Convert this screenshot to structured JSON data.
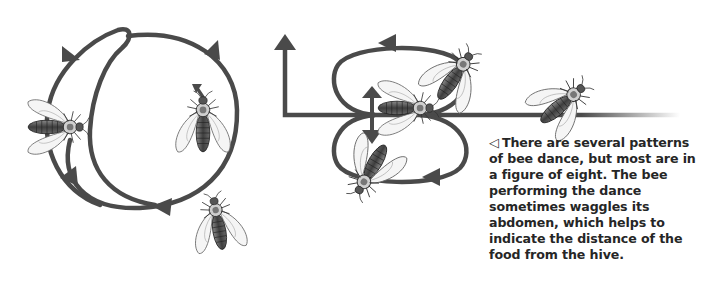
{
  "figure": {
    "caption": {
      "marker": "◁",
      "text": "There are several patterns of bee dance, but most are in a figure of eight. The bee performing the dance sometimes waggles its abdomen, which helps to indicate the distance of the food from the hive."
    },
    "colors": {
      "path_line": "#4a4a4a",
      "bee_body": "#5a5a5a",
      "bee_wing": "#f4f4f4",
      "text": "#262626",
      "background": "#ffffff"
    },
    "panels": [
      {
        "name": "round-dance",
        "description": "circular loop path with arrowheads and three bees"
      },
      {
        "name": "waggle-dance",
        "description": "figure-of-eight path with waggle run, up arrow and three bees"
      }
    ]
  }
}
